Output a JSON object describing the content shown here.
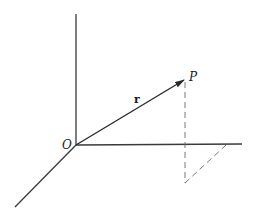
{
  "diagram": {
    "labels": {
      "origin": "O",
      "point": "P",
      "vector": "r"
    },
    "colors": {
      "background": "#ffffff",
      "lines": "#2a2a2a",
      "dashed": "#6a6a6a"
    },
    "geometry": {
      "origin": [
        76,
        145
      ],
      "z_axis_end": [
        76,
        14
      ],
      "y_axis_end": [
        242,
        144
      ],
      "x_axis_end": [
        15,
        207
      ],
      "point_P": [
        185,
        79
      ],
      "projection_foot": [
        185,
        183
      ],
      "projection_on_y_axis": [
        226,
        145
      ]
    }
  }
}
